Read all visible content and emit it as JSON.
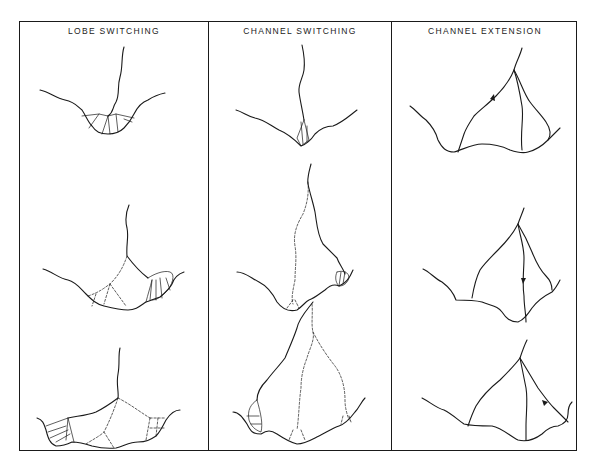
{
  "figure": {
    "panels": [
      {
        "id": "lobe",
        "title": "LOBE SWITCHING",
        "stages": 3
      },
      {
        "id": "channel",
        "title": "CHANNEL SWITCHING",
        "stages": 3
      },
      {
        "id": "extension",
        "title": "CHANNEL EXTENSION",
        "stages": 3
      }
    ],
    "line_styles": {
      "solid": "active channel / basin margin",
      "dashed": "abandoned channel",
      "hatched": "depositional lobe"
    },
    "colors": {
      "ink": "#1a1a1a",
      "background": "#ffffff"
    }
  }
}
